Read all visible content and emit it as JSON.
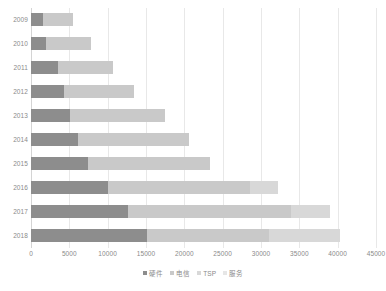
{
  "chart_data": {
    "type": "bar",
    "orientation": "horizontal",
    "stacked": true,
    "title": "",
    "xlabel": "",
    "ylabel": "",
    "categories": [
      "2009",
      "2010",
      "2011",
      "2012",
      "2013",
      "2014",
      "2015",
      "2016",
      "2017",
      "2018"
    ],
    "series": [
      {
        "name": "硬件",
        "color": "#8d8d8d",
        "values": [
          1550,
          2000,
          3500,
          4300,
          5100,
          6150,
          7450,
          10050,
          12650,
          15100
        ]
      },
      {
        "name": "电信",
        "color": "#c9c9c9",
        "values": [
          3900,
          5850,
          7200,
          9200,
          12350,
          14500,
          15900,
          18550,
          21300,
          16000
        ]
      },
      {
        "name": "TSP",
        "color": "#d8d8d8",
        "values": [
          0,
          0,
          0,
          0,
          0,
          0,
          0,
          3600,
          5100,
          9200
        ]
      },
      {
        "name": "服务",
        "color": "#e6e6e6",
        "values": [
          0,
          0,
          0,
          0,
          0,
          0,
          0,
          0,
          0,
          0
        ]
      }
    ],
    "totals": [
      5450,
      7850,
      10700,
      13500,
      17450,
      20650,
      23350,
      32200,
      39050,
      40300
    ],
    "xlim": [
      0,
      45000
    ],
    "xticks": [
      "0",
      "5000",
      "10000",
      "15000",
      "20000",
      "25000",
      "30000",
      "35000",
      "40000",
      "45000"
    ],
    "xtick_values": [
      0,
      5000,
      10000,
      15000,
      20000,
      25000,
      30000,
      35000,
      40000,
      45000
    ],
    "grid": true,
    "grid_axis": "x",
    "legend_position": "bottom"
  },
  "legend": {
    "items": [
      {
        "label": "硬件",
        "color": "#8d8d8d"
      },
      {
        "label": "电信",
        "color": "#c9c9c9"
      },
      {
        "label": "TSP",
        "color": "#d8d8d8"
      },
      {
        "label": "服务",
        "color": "#e6e6e6"
      }
    ]
  },
  "colors": {
    "gridline": "#e8e8e8",
    "axis": "#d4d4d4",
    "text": "#8a8a8a",
    "background": "#ffffff"
  }
}
